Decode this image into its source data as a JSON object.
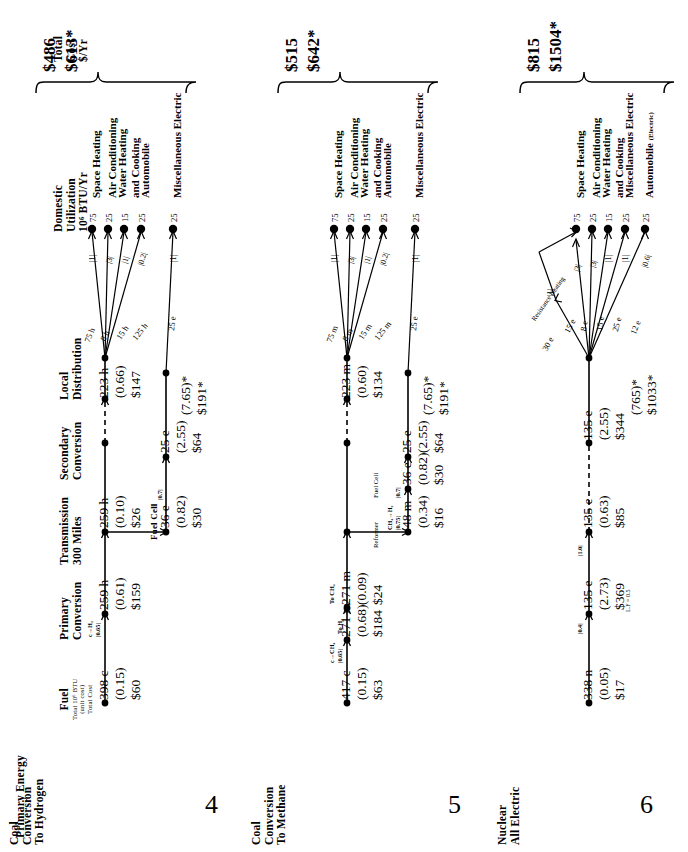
{
  "figure": {
    "orientation": "rotated-90",
    "column_headers": [
      {
        "id": "primary_energy",
        "label": "Primary Energy",
        "sub": ""
      },
      {
        "id": "fuel",
        "label": "Fuel",
        "sub": "Total 10⁶ BTU\n(unit cost)\nTotal Cost"
      },
      {
        "id": "primary_conversion",
        "label": "Primary\nConversion",
        "sub": ""
      },
      {
        "id": "transmission",
        "label": "Transmission\n300 Miles",
        "sub": ""
      },
      {
        "id": "secondary_conversion",
        "label": "Secondary\nConversion",
        "sub": ""
      },
      {
        "id": "local_distribution",
        "label": "Local\nDistribution",
        "sub": ""
      },
      {
        "id": "domestic_utilization",
        "label": "Domestic\nUtilization\n10⁶ BTU/Yr",
        "sub": ""
      },
      {
        "id": "total_cost",
        "label": "Total\nCost\n$/Yr",
        "sub": ""
      }
    ],
    "header_text": {
      "primary_energy": "Primary Energy",
      "fuel_l1": "Fuel",
      "fuel_l2": "Total 10⁶ BTU",
      "fuel_l3": "(unit cost)",
      "fuel_l4": "Total Cost",
      "primary_conversion_l1": "Primary",
      "primary_conversion_l2": "Conversion",
      "transmission_l1": "Transmission",
      "transmission_l2": "300 Miles",
      "secondary_conversion_l1": "Secondary",
      "secondary_conversion_l2": "Conversion",
      "local_distribution_l1": "Local",
      "local_distribution_l2": "Distribution",
      "domestic_utilization_l1": "Domestic",
      "domestic_utilization_l2": "Utilization",
      "domestic_utilization_l3": "10⁶ BTU/Yr",
      "total_cost_l1": "Total",
      "total_cost_l2": "Cost",
      "total_cost_l3": "$/Yr"
    },
    "panels": [
      {
        "number": "4",
        "name_l1": "Coal",
        "name_l2": "Conversion",
        "name_l3": "To Hydrogen",
        "total_cost_main": "$486",
        "total_cost_alt": "$613*",
        "chain": [
          {
            "id": "fuel",
            "qty": "398 c",
            "unit_cost": "(0.15)",
            "total": "$60"
          },
          {
            "id": "primary_conversion",
            "qty": "259 h",
            "unit_cost": "(0.61)",
            "total": "$159",
            "conv_label": "c→H₂",
            "conv_eff": "|0.65|"
          },
          {
            "id": "transmission",
            "qty": "259 h",
            "unit_cost": "(0.10)",
            "total": "$26"
          },
          {
            "id": "local_distribution",
            "qty": "223 h",
            "unit_cost": "(0.66)",
            "total": "$147"
          }
        ],
        "branch_chain": {
          "secondary_label": "Fuel Cell",
          "secondary_eff": "|0.7|",
          "nodes": [
            {
              "id": "secondary_conversion",
              "qty": "36 e",
              "unit_cost": "(0.82)",
              "total": "$30"
            },
            {
              "id": "local_distribution_e",
              "qty": "25 e",
              "unit_cost": "(2.55)",
              "total": "$64"
            }
          ],
          "summary_unit": "(7.65)*",
          "summary_total": "$191*"
        },
        "end_uses": [
          {
            "label": "Space Heating",
            "eff": "|1|",
            "value": "75",
            "feed": "75 h"
          },
          {
            "label": "Air Conditioning",
            "eff": "|3|",
            "value": "25",
            "feed": "8 h"
          },
          {
            "label_l1": "Water Heating",
            "label_l2": "and Cooking",
            "eff": "|1|",
            "value": "15",
            "feed": "15 h"
          },
          {
            "label": "Automobile",
            "eff": "|0.2|",
            "value": "25",
            "feed": "125 h"
          },
          {
            "label": "Miscellaneous Electric",
            "eff": "|1|",
            "value": "25",
            "feed": "25 e"
          }
        ]
      },
      {
        "number": "5",
        "name_l1": "Coal",
        "name_l2": "Conversion",
        "name_l3": "To Methane",
        "total_cost_main": "$515",
        "total_cost_alt": "$642*",
        "chain": [
          {
            "id": "fuel",
            "qty": "417 c",
            "unit_cost": "(0.15)",
            "total": "$63"
          },
          {
            "id": "primary_conversion",
            "qty": "271 m",
            "unit_cost": "(0.68)",
            "total": "$184",
            "conv_label": "c→CH₄",
            "conv_eff": "|0.65|",
            "tag_h2": "To H₂",
            "tag_ch4": "To CH₄"
          },
          {
            "id": "transmission",
            "qty": "271 m",
            "unit_cost": "(0.09)",
            "total": "$24"
          },
          {
            "id": "local_distribution",
            "qty": "223 m",
            "unit_cost": "(0.60)",
            "total": "$134"
          }
        ],
        "branch_chain": {
          "secondary_label_l1": "Reformer",
          "secondary_label_l2": "Fuel Cell",
          "reformer_rxn": "CH₄→H₂",
          "reformer_eff": "|0.75|",
          "fuelcell_eff": "|0.7|",
          "nodes": [
            {
              "id": "reformer_out",
              "qty": "48 m",
              "unit_cost": "(0.34)",
              "total": "$16"
            },
            {
              "id": "secondary_conversion",
              "qty": "36 e",
              "unit_cost": "(0.82)",
              "total": "$30"
            },
            {
              "id": "local_distribution_e",
              "qty": "25 e",
              "unit_cost": "(2.55)",
              "total": "$64"
            }
          ],
          "summary_unit": "(7.65)*",
          "summary_total": "$191*"
        },
        "end_uses": [
          {
            "label": "Space Heating",
            "eff": "|1|",
            "value": "75",
            "feed": "75 m"
          },
          {
            "label": "Air Conditioning",
            "eff": "|3|",
            "value": "25",
            "feed": "8 m"
          },
          {
            "label_l1": "Water Heating",
            "label_l2": "and Cooking",
            "eff": "|1|",
            "value": "15",
            "feed": "15 m"
          },
          {
            "label": "Automobile",
            "eff": "|0.2|",
            "value": "25",
            "feed": "125 m"
          },
          {
            "label": "Miscellaneous Electric",
            "eff": "|1|",
            "value": "25",
            "feed": "25 e"
          }
        ]
      },
      {
        "number": "6",
        "name_l1": "Nuclear",
        "name_l2": "All Electric",
        "name_l3": "",
        "total_cost_main": "$815",
        "total_cost_alt": "$1504*",
        "chain": [
          {
            "id": "fuel",
            "qty": "338 n",
            "unit_cost": "(0.05)",
            "total": "$17",
            "conv_eff": "|0.4|"
          },
          {
            "id": "primary_conversion",
            "qty": "135 e",
            "unit_cost": "(2.73)",
            "total": "$369",
            "note": "L.F = 0.5",
            "conv_eff": "|1.0|"
          },
          {
            "id": "transmission",
            "qty": "135 e",
            "unit_cost": "(0.63)",
            "total": "$85"
          },
          {
            "id": "local_distribution",
            "qty": "135 e",
            "unit_cost": "(2.55)",
            "total": "$344"
          }
        ],
        "summary_unit": "(765)*",
        "summary_total": "$1033*",
        "resistance_label": "Resistance Heating",
        "resistance_eff": "|1|",
        "resistance_feed": "30 e",
        "end_uses": [
          {
            "label": "Space Heating",
            "eff": "|3|",
            "value": "75",
            "feed": "15 e"
          },
          {
            "label": "Air Conditioning",
            "eff": "|3|",
            "value": "25",
            "feed": "8 e"
          },
          {
            "label_l1": "Water Heating",
            "label_l2": "and Cooking",
            "eff": "|1|",
            "value": "15",
            "feed": "15 e"
          },
          {
            "label": "Miscellaneous Electric",
            "eff": "|1|",
            "value": "25",
            "feed": "25 e"
          },
          {
            "label": "Automobile",
            "sublabel": "(Electric)",
            "eff": "|0.6|",
            "value": "25",
            "feed": "12 e"
          }
        ]
      }
    ]
  }
}
